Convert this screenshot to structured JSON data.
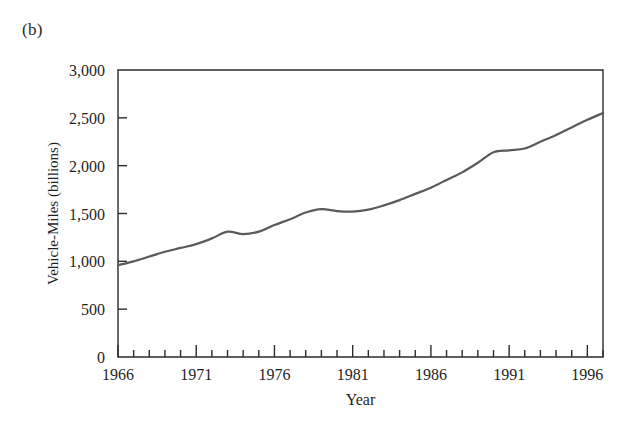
{
  "figure": {
    "panel_label": "(b)"
  },
  "chart_data": {
    "type": "line",
    "title": "",
    "subtitle": "",
    "xlabel": "Year",
    "ylabel": "Vehicle-Miles (billions)",
    "xlim": [
      1966,
      1997
    ],
    "ylim": [
      0,
      3000
    ],
    "grid": false,
    "legend": null,
    "x_major_ticks": [
      1966,
      1971,
      1976,
      1981,
      1986,
      1991,
      1996
    ],
    "x_tick_labels": [
      "1966",
      "1971",
      "1976",
      "1981",
      "1986",
      "1991",
      "1996"
    ],
    "x_minor_tick_step": 1,
    "y_ticks": [
      0,
      500,
      1000,
      1500,
      2000,
      2500,
      3000
    ],
    "y_tick_labels": [
      "0",
      "500",
      "1,000",
      "1,500",
      "2,000",
      "2,500",
      "3,000"
    ],
    "line_color": "#5a5a5a",
    "line_width": 2.2,
    "frame_color": "#2b2b2b",
    "x": [
      1966,
      1967,
      1968,
      1969,
      1970,
      1971,
      1972,
      1973,
      1974,
      1975,
      1976,
      1977,
      1978,
      1979,
      1980,
      1981,
      1982,
      1983,
      1984,
      1985,
      1986,
      1987,
      1988,
      1989,
      1990,
      1991,
      1992,
      1993,
      1994,
      1995,
      1996,
      1997
    ],
    "series": [
      {
        "name": "Vehicle-Miles",
        "values": [
          960,
          1000,
          1050,
          1100,
          1140,
          1180,
          1240,
          1310,
          1285,
          1310,
          1380,
          1440,
          1510,
          1545,
          1525,
          1520,
          1540,
          1585,
          1640,
          1705,
          1770,
          1850,
          1930,
          2030,
          2140,
          2160,
          2180,
          2250,
          2320,
          2400,
          2480,
          2550
        ]
      }
    ]
  }
}
